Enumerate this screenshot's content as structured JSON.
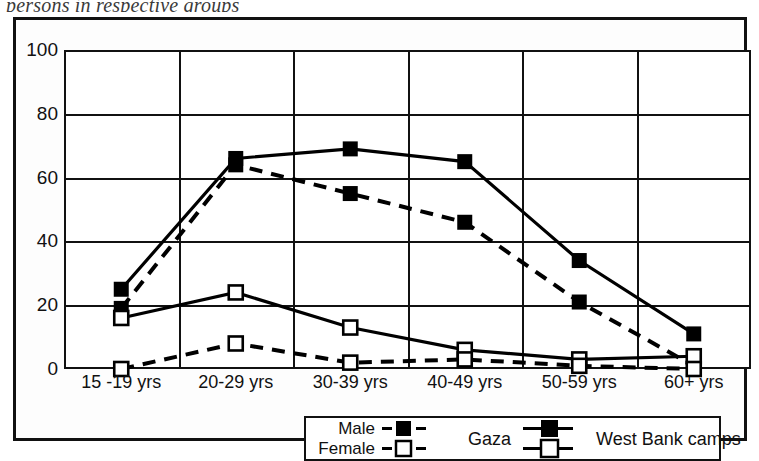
{
  "caption": "persons in respective groups",
  "chart_data": {
    "type": "line",
    "title": "",
    "xlabel": "",
    "ylabel": "",
    "categories": [
      "15 -19 yrs",
      "20-29 yrs",
      "30-39 yrs",
      "40-49 yrs",
      "50-59 yrs",
      "60+ yrs"
    ],
    "yticks": [
      0,
      20,
      40,
      60,
      80,
      100
    ],
    "ylim": [
      0,
      100
    ],
    "grid": true,
    "legend_position": "bottom",
    "series": [
      {
        "name": "Male - West Bank camps",
        "marker": "filled-square",
        "line": "solid",
        "color": "#000000",
        "values": [
          25,
          66,
          69,
          65,
          34,
          11
        ]
      },
      {
        "name": "Male - Gaza",
        "marker": "filled-square",
        "line": "dashed",
        "color": "#000000",
        "values": [
          19,
          64,
          55,
          46,
          21,
          1
        ]
      },
      {
        "name": "Female - West Bank camps",
        "marker": "open-square",
        "line": "solid",
        "color": "#000000",
        "values": [
          16,
          24,
          13,
          6,
          3,
          4
        ]
      },
      {
        "name": "Female - Gaza",
        "marker": "open-square",
        "line": "dashed",
        "color": "#000000",
        "values": [
          0,
          8,
          2,
          3,
          1,
          0
        ]
      }
    ]
  },
  "legend": {
    "rows": [
      {
        "label": "Male",
        "marker": "filled-square"
      },
      {
        "label": "Female",
        "marker": "open-square"
      }
    ],
    "groups": [
      {
        "label": "Gaza",
        "line": "dashed"
      },
      {
        "label": "West Bank camps",
        "line": "solid"
      }
    ]
  }
}
